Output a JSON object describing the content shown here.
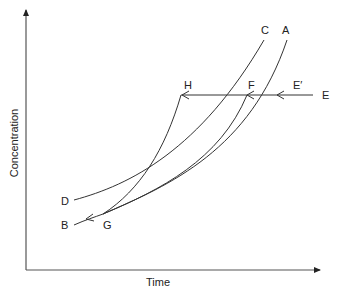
{
  "diagram": {
    "type": "concentration-time phase diagram",
    "x_axis": {
      "label": "Time"
    },
    "y_axis": {
      "label": "Concentration"
    },
    "curves": [
      {
        "id": "A",
        "label": "A",
        "description": "upper-right curve from G rising to A"
      },
      {
        "id": "C",
        "label": "C",
        "description": "curve from D rising to C"
      },
      {
        "id": "B",
        "label": "B",
        "description": "curve from G down to B with arrow toward B"
      },
      {
        "id": "GH",
        "label": "H",
        "description": "steep curve from G up to H"
      },
      {
        "id": "GF",
        "label": "F",
        "description": "curve from G up to F"
      }
    ],
    "points": {
      "A": "A",
      "B": "B",
      "C": "C",
      "D": "D",
      "E": "E",
      "E_prime": "E′",
      "F": "F",
      "G": "G",
      "H": "H"
    },
    "horizontal_path": {
      "from": "E",
      "to": "H",
      "through": [
        "E′",
        "F"
      ],
      "arrows": "pointing left"
    },
    "colors": {
      "line": "#333333",
      "text": "#222222",
      "background": "#ffffff"
    }
  }
}
